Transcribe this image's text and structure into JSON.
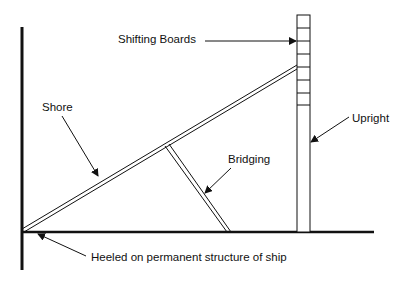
{
  "diagram": {
    "labels": {
      "shifting_boards": "Shifting Boards",
      "shore": "Shore",
      "upright": "Upright",
      "bridging": "Bridging",
      "heeled": "Heeled on permanent structure of ship"
    },
    "colors": {
      "stroke": "#111111",
      "background": "#ffffff"
    }
  }
}
